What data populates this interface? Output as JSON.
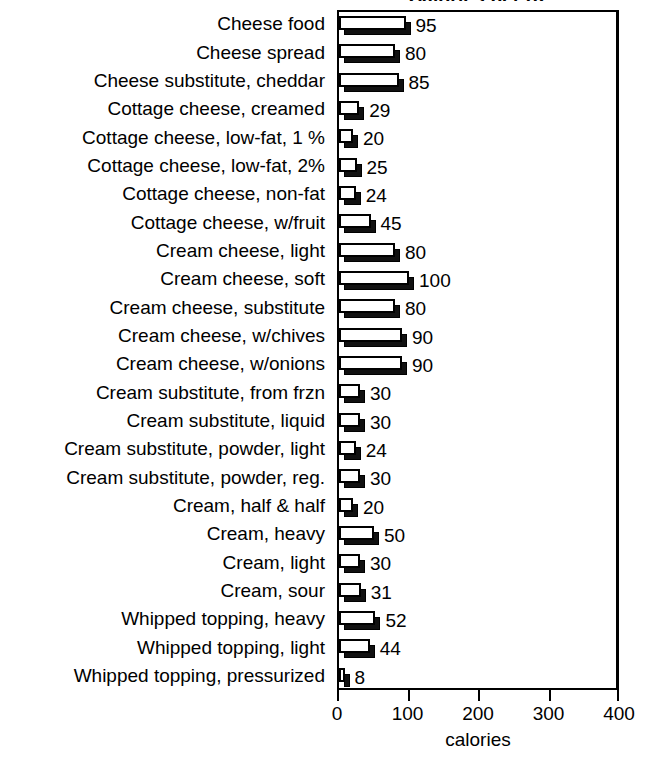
{
  "chart_data": {
    "type": "bar",
    "orientation": "horizontal",
    "title": "Calories per oz",
    "xlabel": "calories",
    "ylabel": "",
    "xlim": [
      0,
      400
    ],
    "xticks": [
      0,
      100,
      200,
      300,
      400
    ],
    "xtick_labels": [
      "0",
      "100",
      "200",
      "300",
      "400"
    ],
    "grid": false,
    "legend": false,
    "value_labels": true,
    "categories": [
      "Cheese food",
      "Cheese spread",
      "Cheese substitute, cheddar",
      "Cottage cheese, creamed",
      "Cottage cheese, low-fat, 1 %",
      "Cottage cheese, low-fat, 2%",
      "Cottage cheese, non-fat",
      "Cottage cheese, w/fruit",
      "Cream cheese, light",
      "Cream cheese, soft",
      "Cream cheese, substitute",
      "Cream cheese, w/chives",
      "Cream cheese, w/onions",
      "Cream substitute, from frzn",
      "Cream substitute, liquid",
      "Cream substitute, powder, light",
      "Cream substitute, powder, reg.",
      "Cream, half & half",
      "Cream, heavy",
      "Cream, light",
      "Cream, sour",
      "Whipped topping, heavy",
      "Whipped topping, light",
      "Whipped topping, pressurized"
    ],
    "values": [
      95,
      80,
      85,
      29,
      20,
      25,
      24,
      45,
      80,
      100,
      80,
      90,
      90,
      30,
      30,
      24,
      30,
      20,
      50,
      30,
      31,
      52,
      44,
      8
    ],
    "value_label_text": [
      "95",
      "80",
      "85",
      "29",
      "20",
      "25",
      "24",
      "45",
      "80",
      "100",
      "80",
      "90",
      "90",
      "30",
      "30",
      "24",
      "30",
      "20",
      "50",
      "30",
      "31",
      "52",
      "44",
      "8"
    ]
  },
  "style": {
    "bar_face_color": "#ffffff",
    "bar_edge_color": "#000000",
    "bar_shadow_color": "#111111",
    "axis_color": "#000000",
    "background": "#ffffff",
    "text_color": "#000000"
  }
}
